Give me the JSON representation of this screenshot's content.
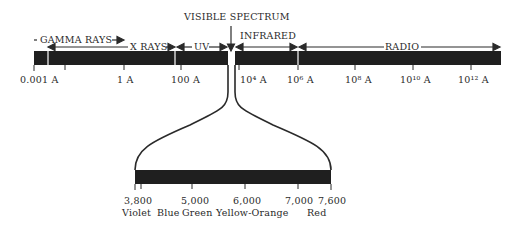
{
  "diagram": {
    "title": "VISIBLE SPECTRUM",
    "bands": [
      {
        "name": "GAMMA RAYS"
      },
      {
        "name": "X RAYS"
      },
      {
        "name": "UV"
      },
      {
        "name": "INFRARED"
      },
      {
        "name": "RADIO"
      }
    ],
    "top_scale": [
      "0.001 A",
      "1 A",
      "100 A",
      "10⁴ A",
      "10⁶ A",
      "10⁸ A",
      "10¹⁰ A",
      "10¹² A"
    ],
    "visible_scale": [
      "3,800",
      "5,000",
      "6,000",
      "7,000",
      "7,600"
    ],
    "visible_colors": [
      "Violet",
      "Blue",
      "Green",
      "Yellow-Orange",
      "Red"
    ],
    "bar_color": "#1f1f1f"
  }
}
